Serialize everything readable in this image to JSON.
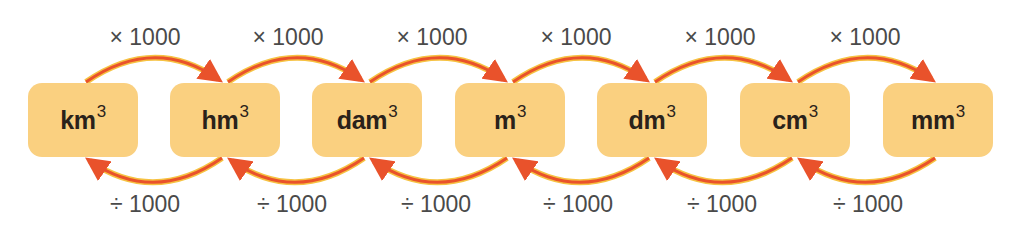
{
  "diagram": {
    "colors": {
      "box_fill": "#fad080",
      "arrow_red": "#e9522b",
      "arrow_yellow": "#f6c242",
      "text_dark": "#2a221a",
      "op_text": "#4a4a4a"
    },
    "units": [
      {
        "base": "km",
        "exp": "3"
      },
      {
        "base": "hm",
        "exp": "3"
      },
      {
        "base": "dam",
        "exp": "3"
      },
      {
        "base": "m",
        "exp": "3"
      },
      {
        "base": "dm",
        "exp": "3"
      },
      {
        "base": "cm",
        "exp": "3"
      },
      {
        "base": "mm",
        "exp": "3"
      }
    ],
    "multiply_labels": [
      "× 1000",
      "× 1000",
      "× 1000",
      "× 1000",
      "× 1000",
      "× 1000"
    ],
    "divide_labels": [
      "÷ 1000",
      "÷ 1000",
      "÷ 1000",
      "÷ 1000",
      "÷ 1000",
      "÷ 1000"
    ]
  }
}
